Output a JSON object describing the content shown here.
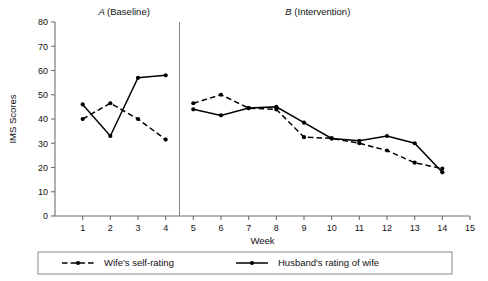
{
  "chart_data": {
    "type": "line",
    "title": "",
    "xlabel": "Week",
    "ylabel": "IMS Scores",
    "xlim": [
      0,
      15
    ],
    "ylim": [
      0,
      80
    ],
    "ytick_step": 10,
    "yticks": [
      0,
      10,
      20,
      30,
      40,
      50,
      60,
      70,
      80
    ],
    "xticks": [
      1,
      2,
      3,
      4,
      5,
      6,
      7,
      8,
      9,
      10,
      11,
      12,
      13,
      14,
      15
    ],
    "grid": false,
    "legend_position": "bottom",
    "phases": [
      {
        "letter": "A",
        "name": "(Baseline)",
        "weeks": [
          1,
          4
        ]
      },
      {
        "letter": "B",
        "name": "(Intervention)",
        "weeks": [
          5,
          14
        ]
      }
    ],
    "phase_change_at_x": 4.5,
    "x": [
      1,
      2,
      3,
      4,
      5,
      6,
      7,
      8,
      9,
      10,
      11,
      12,
      13,
      14
    ],
    "series": [
      {
        "name": "Wife's self-rating",
        "style": "dashed",
        "marker": "circle",
        "color": "#000000",
        "phase_a_x": [
          1,
          2,
          3,
          4
        ],
        "phase_a_values": [
          40,
          46.5,
          40,
          31.5
        ],
        "phase_b_x": [
          5,
          6,
          7,
          8,
          9,
          10,
          11,
          12,
          13,
          14
        ],
        "phase_b_values": [
          46.5,
          50,
          44.5,
          44,
          32.5,
          32,
          30,
          27,
          22,
          19.5
        ]
      },
      {
        "name": "Husband's rating of wife",
        "style": "solid",
        "marker": "circle",
        "color": "#000000",
        "phase_a_x": [
          1,
          2,
          3,
          4
        ],
        "phase_a_values": [
          46,
          33,
          57,
          58
        ],
        "phase_b_x": [
          5,
          6,
          7,
          8,
          9,
          10,
          11,
          12,
          13,
          14
        ],
        "phase_b_values": [
          44,
          41.5,
          44.5,
          45,
          38.5,
          32,
          31,
          33,
          30,
          18
        ]
      }
    ]
  },
  "legend": {
    "items": [
      {
        "label": "Wife's self-rating",
        "style": "dashed"
      },
      {
        "label": "Husband's rating of wife",
        "style": "solid"
      }
    ]
  }
}
